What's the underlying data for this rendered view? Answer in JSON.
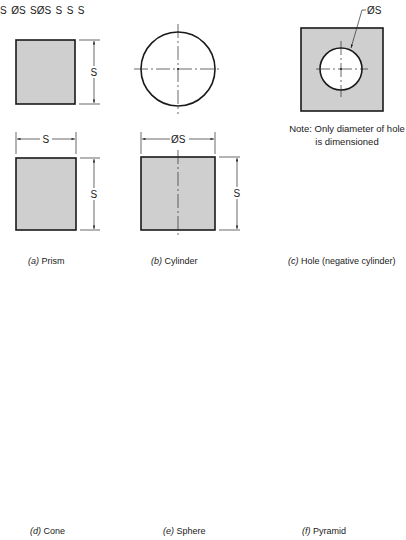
{
  "figure": {
    "panels": [
      {
        "id": "a",
        "letter": "(a)",
        "name": "Prism",
        "dimensions": [
          "S",
          "S",
          "S"
        ]
      },
      {
        "id": "b",
        "letter": "(b)",
        "name": "Cylinder",
        "dimensions": [
          "ØS",
          "S"
        ]
      },
      {
        "id": "c",
        "letter": "(c)",
        "name": "Hole (negative cylinder)",
        "dimensions": [
          "ØS"
        ],
        "note_line1": "Note: Only diameter of hole",
        "note_line2": "is dimensioned"
      },
      {
        "id": "d",
        "letter": "(d)",
        "name": "Cone",
        "dimensions": [
          "S",
          "ØS"
        ]
      },
      {
        "id": "e",
        "letter": "(e)",
        "name": "Sphere",
        "dimensions": [
          "SØS"
        ]
      },
      {
        "id": "f",
        "letter": "(f)",
        "name": "Pyramid",
        "dimensions": [
          "S",
          "S",
          "S"
        ]
      }
    ],
    "colors": {
      "shading": "#cfcfcf",
      "line": "#1a1a1a",
      "background": "#ffffff"
    }
  },
  "dims": {
    "a_top_height": "S",
    "a_front_width": "S",
    "a_front_height": "S",
    "b_diameter": "ØS",
    "b_height": "S",
    "c_diameter": "ØS",
    "d_height": "S",
    "d_diameter": "ØS",
    "e_diameter": "SØS",
    "f_top_height": "S",
    "f_top_width": "S",
    "f_front_height": "S"
  }
}
